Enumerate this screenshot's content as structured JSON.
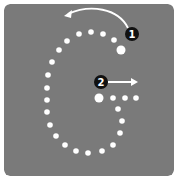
{
  "diagram": {
    "letter": "G",
    "colors": {
      "background": "#7a7a7a",
      "dots": "#ffffff",
      "arrows": "#ffffff",
      "badge_fill": "#111111",
      "badge_text": "#ffffff"
    },
    "strokes": [
      {
        "step": "1",
        "label": "Start at the top right and curve around counter-clockwise",
        "start_dot": {
          "x": 121,
          "y": 50,
          "r": 4.5
        },
        "dots": [
          {
            "x": 114,
            "y": 40
          },
          {
            "x": 103,
            "y": 34
          },
          {
            "x": 91,
            "y": 32
          },
          {
            "x": 79,
            "y": 34
          },
          {
            "x": 67,
            "y": 41
          },
          {
            "x": 59,
            "y": 50
          },
          {
            "x": 52,
            "y": 62
          },
          {
            "x": 48,
            "y": 75
          },
          {
            "x": 47,
            "y": 88
          },
          {
            "x": 47,
            "y": 100
          },
          {
            "x": 47,
            "y": 112
          },
          {
            "x": 50,
            "y": 125
          },
          {
            "x": 56,
            "y": 136
          },
          {
            "x": 65,
            "y": 145
          },
          {
            "x": 76,
            "y": 151
          },
          {
            "x": 88,
            "y": 153
          },
          {
            "x": 102,
            "y": 151
          },
          {
            "x": 113,
            "y": 145
          },
          {
            "x": 120,
            "y": 133
          },
          {
            "x": 122,
            "y": 121
          },
          {
            "x": 118,
            "y": 109
          }
        ],
        "badge": {
          "x": 132,
          "y": 34,
          "text": "1"
        },
        "arrow": "curved-left"
      },
      {
        "step": "2",
        "label": "Horizontal stroke to the right",
        "start_dot": {
          "x": 99,
          "y": 98,
          "r": 4.5
        },
        "dots": [
          {
            "x": 113,
            "y": 98
          },
          {
            "x": 125,
            "y": 98
          },
          {
            "x": 136,
            "y": 98
          }
        ],
        "badge": {
          "x": 101,
          "y": 82,
          "text": "2"
        },
        "arrow": "straight-right"
      }
    ]
  }
}
